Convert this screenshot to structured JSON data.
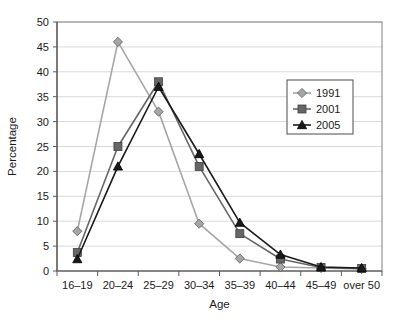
{
  "chart_data": {
    "type": "line",
    "title": "",
    "xlabel": "Age",
    "ylabel": "Percentage",
    "categories": [
      "16–19",
      "20–24",
      "25–29",
      "30–34",
      "35–39",
      "40–44",
      "45–49",
      "over 50"
    ],
    "ylim": [
      0,
      50
    ],
    "yticks": [
      0,
      5,
      10,
      15,
      20,
      25,
      30,
      35,
      40,
      45,
      50
    ],
    "ytick_labels": [
      "0",
      "5",
      "10",
      "15",
      "20",
      "25",
      "30",
      "35",
      "40",
      "45",
      "50"
    ],
    "grid": true,
    "grid_axis": "y",
    "legend_position": "upper right",
    "series": [
      {
        "name": "1991",
        "marker": "diamond",
        "color": "#a6a6a6",
        "values": [
          8,
          46,
          32,
          9.5,
          2.5,
          0.8,
          0.6,
          0.4
        ]
      },
      {
        "name": "2001",
        "marker": "square",
        "color": "#666666",
        "values": [
          3.7,
          25,
          38,
          21,
          7.5,
          2.4,
          0.7,
          0.5
        ]
      },
      {
        "name": "2005",
        "marker": "triangle",
        "color": "#1a1a1a",
        "values": [
          2.4,
          21,
          37,
          23.5,
          9.7,
          3.3,
          0.8,
          0.6
        ]
      }
    ]
  },
  "legend": {
    "entries": [
      {
        "label": "1991"
      },
      {
        "label": "2001"
      },
      {
        "label": "2005"
      }
    ]
  },
  "colors": {
    "plot_border": "#808080",
    "gridline": "#d9d9d9",
    "axis": "#595959",
    "background": "#ffffff"
  }
}
